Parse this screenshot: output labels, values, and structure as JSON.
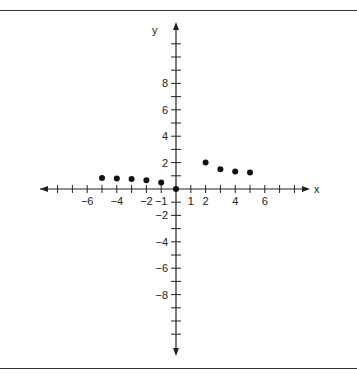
{
  "chart_data": {
    "type": "scatter",
    "title": "",
    "xlabel": "x",
    "ylabel": "y",
    "xlim": [
      -9,
      9
    ],
    "ylim": [
      -11,
      11
    ],
    "grid": false,
    "x_tick_labels": [
      "-6",
      "-4",
      "-2",
      "-1",
      "1",
      "2",
      "4",
      "6"
    ],
    "y_tick_labels": [
      "8",
      "6",
      "4",
      "2",
      "-2",
      "-4",
      "-6",
      "-8"
    ],
    "series": [
      {
        "name": "points",
        "x": [
          -5,
          -4,
          -3,
          -2,
          -1,
          0,
          2,
          3,
          4,
          5
        ],
        "y": [
          0.83,
          0.8,
          0.75,
          0.67,
          0.5,
          0,
          2,
          1.5,
          1.33,
          1.25
        ]
      }
    ]
  },
  "labels": {
    "x_axis": "x",
    "y_axis": "y",
    "xticks": [
      {
        "v": -6,
        "t": "−6"
      },
      {
        "v": -4,
        "t": "−4"
      },
      {
        "v": -2,
        "t": "−2"
      },
      {
        "v": -1,
        "t": "−1"
      },
      {
        "v": 1,
        "t": "1"
      },
      {
        "v": 2,
        "t": "2"
      },
      {
        "v": 4,
        "t": "4"
      },
      {
        "v": 6,
        "t": "6"
      }
    ],
    "yticks": [
      {
        "v": 8,
        "t": "8"
      },
      {
        "v": 6,
        "t": "6"
      },
      {
        "v": 4,
        "t": "4"
      },
      {
        "v": 2,
        "t": "2"
      },
      {
        "v": -2,
        "t": "−2"
      },
      {
        "v": -4,
        "t": "−4"
      },
      {
        "v": -6,
        "t": "−6"
      },
      {
        "v": -8,
        "t": "−8"
      }
    ]
  }
}
